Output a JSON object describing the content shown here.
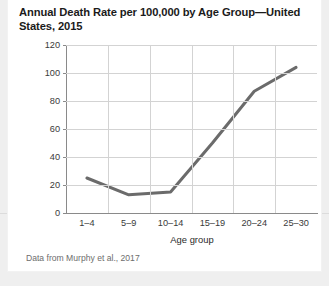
{
  "title": "Annual Death Rate per 100,000 by Age Group—United States, 2015",
  "caption": "Data from Murphy et al., 2017",
  "chart_data": {
    "type": "line",
    "title": "Annual Death Rate per 100,000 by Age Group—United States, 2015",
    "xlabel": "Age group",
    "ylabel": "",
    "categories": [
      "1–4",
      "5–9",
      "10–14",
      "15–19",
      "20–24",
      "25–30"
    ],
    "values": [
      25,
      13,
      15,
      50,
      87,
      104
    ],
    "ylim": [
      0,
      120
    ],
    "yticks": [
      0,
      20,
      40,
      60,
      80,
      100,
      120
    ],
    "ytick_labels": [
      "0",
      "20",
      "40",
      "60",
      "80",
      "100",
      "120"
    ],
    "grid": true,
    "legend": null,
    "line_color": "#6b6b6b",
    "line_width": 3
  }
}
